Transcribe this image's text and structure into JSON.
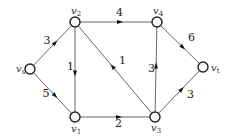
{
  "diagram": {
    "type": "directed-network",
    "nodes": [
      {
        "id": "vs",
        "label": "v",
        "sub": "s",
        "x": 30,
        "y": 69
      },
      {
        "id": "v2",
        "label": "v",
        "sub": "2",
        "x": 75,
        "y": 22
      },
      {
        "id": "v4",
        "label": "v",
        "sub": "4",
        "x": 157,
        "y": 22
      },
      {
        "id": "vt",
        "label": "v",
        "sub": "t",
        "x": 203,
        "y": 67
      },
      {
        "id": "v1",
        "label": "v",
        "sub": "1",
        "x": 75,
        "y": 117
      },
      {
        "id": "v3",
        "label": "v",
        "sub": "3",
        "x": 155,
        "y": 117
      }
    ],
    "edges": [
      {
        "from": "vs",
        "to": "v2",
        "weight": "3"
      },
      {
        "from": "vs",
        "to": "v1",
        "weight": "5"
      },
      {
        "from": "v2",
        "to": "v4",
        "weight": "4"
      },
      {
        "from": "v2",
        "to": "v1",
        "weight": "1"
      },
      {
        "from": "v3",
        "to": "v2",
        "weight": "1"
      },
      {
        "from": "v1",
        "to": "v3",
        "weight": "2"
      },
      {
        "from": "v3",
        "to": "v4",
        "weight": "3"
      },
      {
        "from": "v4",
        "to": "vt",
        "weight": "6"
      },
      {
        "from": "v3",
        "to": "vt",
        "weight": "3"
      }
    ]
  }
}
